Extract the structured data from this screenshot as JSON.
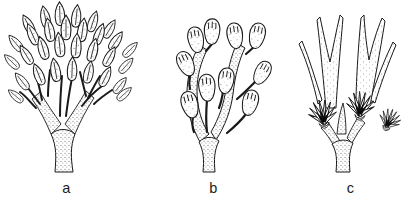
{
  "figure": {
    "background": "#ffffff",
    "ink_color": "#1a1a1a",
    "panels": [
      {
        "label": "a",
        "drawing": "dense-bushy-branch-with-lanceolate-pointed-buds"
      },
      {
        "label": "b",
        "drawing": "forked-branch-with-oval-egg-shaped-buds"
      },
      {
        "label": "c",
        "drawing": "branch-with-long-forked-lobes-and-dark-centered-polyp-fans"
      }
    ]
  }
}
